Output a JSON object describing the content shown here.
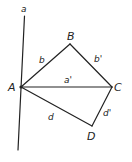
{
  "diagram": {
    "points": {
      "A": "A",
      "B": "B",
      "C": "C",
      "D": "D"
    },
    "lines": {
      "a": "a",
      "b": "b",
      "b_prime": "b'",
      "a_prime": "a'",
      "d": "d",
      "d_prime": "d'"
    },
    "segments": [
      {
        "from": "A",
        "to": "B",
        "label": "b"
      },
      {
        "from": "B",
        "to": "C",
        "label": "b'"
      },
      {
        "from": "A",
        "to": "C",
        "label": "a'"
      },
      {
        "from": "A",
        "to": "D",
        "label": "d"
      },
      {
        "from": "D",
        "to": "C",
        "label": "d'"
      }
    ],
    "line_through_A": "a"
  }
}
